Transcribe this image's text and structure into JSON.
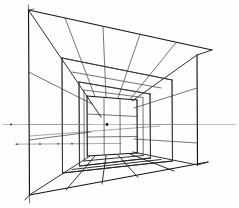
{
  "document": {
    "kind": "hand-drawn-perspective-study",
    "title": "One-Point Perspective Room Grid",
    "medium": "pen on paper",
    "canvas": {
      "width": 239,
      "height": 208
    },
    "background_color": "#fdfdfc",
    "ink_color": "#151515",
    "guide_color": "#8a8a8a"
  },
  "geometry": {
    "vanishing_point": {
      "x": 107,
      "y": 124.5
    },
    "horizon_line": {
      "y": 124.5,
      "x_start": 3,
      "x_end": 236
    },
    "secondary_ground_line": {
      "y": 144,
      "x_start": 15,
      "x_end": 120
    },
    "horizon_ticks": [
      {
        "x": 11,
        "y": 124.5
      },
      {
        "x": 107,
        "y": 124.5
      }
    ],
    "ground_ticks": [
      {
        "x": 16,
        "y": 144
      },
      {
        "x": 40,
        "y": 144
      },
      {
        "x": 58,
        "y": 144
      },
      {
        "x": 72,
        "y": 144
      }
    ],
    "rectangles": [
      {
        "name": "outer-picture-frame",
        "left": 28,
        "right": 197,
        "top": 10,
        "bottom": 195,
        "top_left": {
          "x": 28,
          "y": 10
        },
        "top_right": {
          "x": 197,
          "y": 55
        },
        "bottom_right": {
          "x": 197,
          "y": 165
        },
        "bottom_left": {
          "x": 28,
          "y": 195
        },
        "weight": "heavy"
      },
      {
        "name": "second-depth-rectangle",
        "top_left": {
          "x": 62,
          "y": 58
        },
        "top_right": {
          "x": 172,
          "y": 80
        },
        "bottom_right": {
          "x": 172,
          "y": 161
        },
        "bottom_left": {
          "x": 62,
          "y": 173
        },
        "weight": "mid"
      },
      {
        "name": "third-depth-rectangle",
        "top_left": {
          "x": 79,
          "y": 82
        },
        "top_right": {
          "x": 150,
          "y": 94
        },
        "bottom_right": {
          "x": 150,
          "y": 158
        },
        "bottom_left": {
          "x": 79,
          "y": 166
        },
        "weight": "mid"
      },
      {
        "name": "back-wall-rectangle",
        "top_left": {
          "x": 87,
          "y": 96
        },
        "top_right": {
          "x": 137,
          "y": 100
        },
        "bottom_right": {
          "x": 137,
          "y": 153
        },
        "bottom_left": {
          "x": 87,
          "y": 156
        },
        "weight": "heavy"
      }
    ],
    "orthogonal_rays": {
      "description": "lines radiating from the vanishing point to the outer frame corners and edge divisions",
      "corner_rays": [
        {
          "from": {
            "x": 28,
            "y": 10
          },
          "to": {
            "x": 107,
            "y": 124.5
          }
        },
        {
          "from": {
            "x": 197,
            "y": 55
          },
          "to": {
            "x": 107,
            "y": 124.5
          }
        },
        {
          "from": {
            "x": 197,
            "y": 165
          },
          "to": {
            "x": 107,
            "y": 124.5
          }
        },
        {
          "from": {
            "x": 28,
            "y": 195
          },
          "to": {
            "x": 107,
            "y": 124.5
          }
        }
      ]
    },
    "ceiling_grid": {
      "transverse_line_count": 4,
      "radiating_line_count": 5
    },
    "floor_grid": {
      "transverse_line_count": 4,
      "radiating_line_count": 5
    },
    "left_wall_grid": {
      "vertical_divisions": 3,
      "horizontal_divisions": 3
    },
    "right_wall_grid": {
      "vertical_divisions": 3,
      "horizontal_divisions": 3
    },
    "back_wall_grid": {
      "vertical_divisions": 2,
      "horizontal_divisions": 2
    }
  }
}
